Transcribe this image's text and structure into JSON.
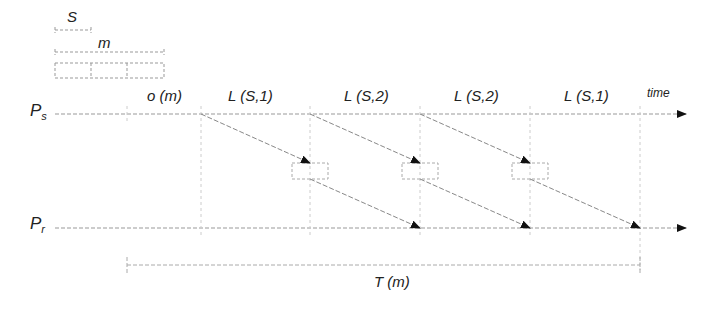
{
  "legend": {
    "packet_label": "S",
    "message_label": "m",
    "cells": 3
  },
  "processes": {
    "sender": {
      "label": "P",
      "subscript": "s"
    },
    "receiver": {
      "label": "P",
      "subscript": "r"
    }
  },
  "axis": {
    "label": "time"
  },
  "segments": [
    {
      "label": "o (m)"
    },
    {
      "label": "L (S,1)"
    },
    {
      "label": "L (S,2)"
    },
    {
      "label": "L (S,2)"
    },
    {
      "label": "L (S,1)"
    }
  ],
  "total": {
    "label": "T (m)"
  },
  "colors": {
    "line": "#9a9a9a",
    "arrow": "#111111",
    "text": "#222222"
  }
}
